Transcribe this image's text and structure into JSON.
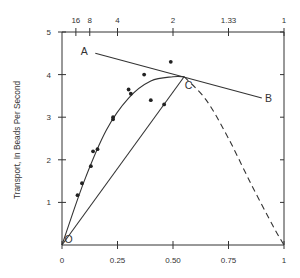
{
  "chart_data": {
    "type": "scatter",
    "title": "",
    "xlabel": "",
    "ylabel": "Transport, In Beads Per Second",
    "xlim": [
      0,
      1
    ],
    "ylim": [
      0,
      5
    ],
    "grid": false,
    "legend": null,
    "x_ticks": [
      {
        "value": 0,
        "label": "0"
      },
      {
        "value": 0.25,
        "label": "0.25"
      },
      {
        "value": 0.5,
        "label": "0.50"
      },
      {
        "value": 0.75,
        "label": "0.75"
      },
      {
        "value": 1,
        "label": "1"
      }
    ],
    "top_ticks": [
      {
        "value": 0.0625,
        "label": "16"
      },
      {
        "value": 0.125,
        "label": "8"
      },
      {
        "value": 0.25,
        "label": "4"
      },
      {
        "value": 0.5,
        "label": "2"
      },
      {
        "value": 0.75,
        "label": "1.33"
      },
      {
        "value": 1,
        "label": "1"
      }
    ],
    "y_ticks": [
      {
        "value": 1,
        "label": "1"
      },
      {
        "value": 2,
        "label": "2"
      },
      {
        "value": 3,
        "label": "3"
      },
      {
        "value": 4,
        "label": "4"
      },
      {
        "value": 5,
        "label": "5"
      }
    ],
    "series": [
      {
        "name": "observed points",
        "style": "scatter",
        "points": [
          [
            0.07,
            1.17
          ],
          [
            0.09,
            1.45
          ],
          [
            0.13,
            1.85
          ],
          [
            0.14,
            2.2
          ],
          [
            0.16,
            2.25
          ],
          [
            0.23,
            2.95
          ],
          [
            0.23,
            3.0
          ],
          [
            0.3,
            3.65
          ],
          [
            0.31,
            3.55
          ],
          [
            0.37,
            4.0
          ],
          [
            0.4,
            3.4
          ],
          [
            0.46,
            3.3
          ],
          [
            0.49,
            4.3
          ]
        ]
      },
      {
        "name": "fitted curve O to C",
        "style": "solid-curve",
        "points": [
          [
            0,
            0
          ],
          [
            0.1,
            1.5
          ],
          [
            0.2,
            2.7
          ],
          [
            0.3,
            3.45
          ],
          [
            0.4,
            3.85
          ],
          [
            0.5,
            3.95
          ],
          [
            0.55,
            3.95
          ]
        ]
      },
      {
        "name": "dashed extrapolation C to 1",
        "style": "dashed-curve",
        "points": [
          [
            0.55,
            3.95
          ],
          [
            0.65,
            3.4
          ],
          [
            0.75,
            2.5
          ],
          [
            0.85,
            1.45
          ],
          [
            0.95,
            0.45
          ],
          [
            1,
            0
          ]
        ]
      },
      {
        "name": "line O-C",
        "style": "line",
        "points": [
          [
            0,
            0
          ],
          [
            0.55,
            3.95
          ]
        ]
      },
      {
        "name": "tangent A-B",
        "style": "line",
        "points": [
          [
            0.15,
            4.5
          ],
          [
            0.9,
            3.45
          ]
        ]
      }
    ],
    "annotations": [
      {
        "text": "A",
        "x": 0.1,
        "y": 4.55
      },
      {
        "text": "B",
        "x": 0.93,
        "y": 3.45
      },
      {
        "text": "C",
        "x": 0.57,
        "y": 3.75
      },
      {
        "text": "O",
        "x": 0.03,
        "y": 0.15
      }
    ]
  }
}
